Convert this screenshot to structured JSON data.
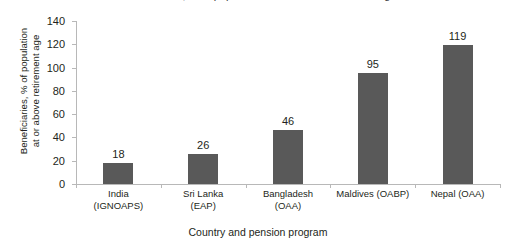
{
  "chart_data": {
    "type": "bar",
    "title": "Beneficiaries, % of population at or above retirement age",
    "xlabel": "Country and pension program",
    "ylabel": "Beneficiaries, % of population at or above retirement age",
    "ylabel_line1": "Beneficiaries, % of population",
    "ylabel_line2": "at or above retirement age",
    "categories": [
      "India (IGNOAPS)",
      "Sri Lanka (EAP)",
      "Bangladesh (OAA)",
      "Maldives (OABP)",
      "Nepal (OAA)"
    ],
    "category_lines": [
      [
        "India",
        "(IGNOAPS)"
      ],
      [
        "Sri Lanka",
        "(EAP)"
      ],
      [
        "Bangladesh",
        "(OAA)"
      ],
      [
        "Maldives (OABP)",
        ""
      ],
      [
        "Nepal (OAA)",
        ""
      ]
    ],
    "values": [
      18,
      26,
      46,
      95,
      119
    ],
    "value_labels": [
      "18",
      "26",
      "46",
      "95",
      "119"
    ],
    "ylim": [
      0,
      140
    ],
    "yticks": [
      0,
      20,
      40,
      60,
      80,
      100,
      120,
      140
    ],
    "ytick_labels": [
      "0",
      "20",
      "40",
      "60",
      "80",
      "100",
      "120",
      "140"
    ],
    "grid": false,
    "legend": false,
    "bar_color": "#595959",
    "axis_color": "#b8b8b8",
    "text_color": "#231f20"
  }
}
